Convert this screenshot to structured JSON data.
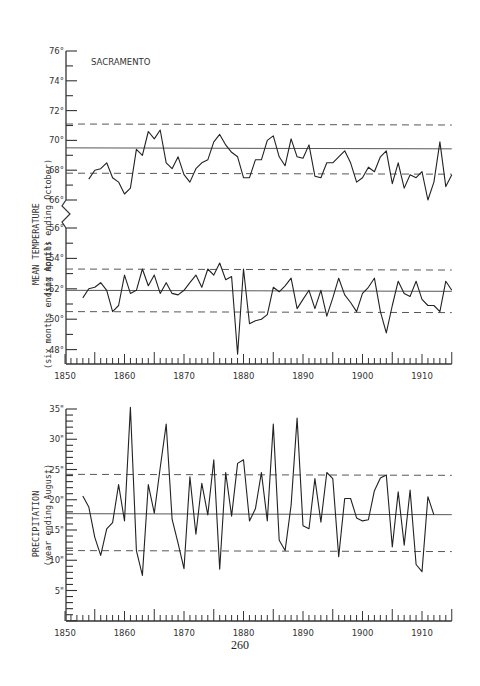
{
  "page": {
    "number": "260"
  },
  "chart_data": [
    {
      "type": "line",
      "title": "SACRAMENTO",
      "panel": "temperature-summer",
      "ylabel": "MEAN TEMPERATURE",
      "ysublabel": "(six months ending October)",
      "ylim": [
        66,
        76
      ],
      "yticks": [
        "66°",
        "68°",
        "70°",
        "72°",
        "74°",
        "76°"
      ],
      "mean": 69.5,
      "upper_dashed": 71.1,
      "lower_dashed": 67.8,
      "x": [
        1854,
        1855,
        1856,
        1857,
        1858,
        1859,
        1860,
        1861,
        1862,
        1863,
        1864,
        1865,
        1866,
        1867,
        1868,
        1869,
        1870,
        1871,
        1872,
        1873,
        1874,
        1875,
        1876,
        1877,
        1878,
        1879,
        1880,
        1881,
        1882,
        1883,
        1884,
        1885,
        1886,
        1887,
        1888,
        1889,
        1890,
        1891,
        1892,
        1893,
        1894,
        1895,
        1896,
        1897,
        1898,
        1899,
        1900,
        1901,
        1902,
        1903,
        1904,
        1905,
        1906,
        1907,
        1908,
        1909,
        1910,
        1911,
        1912,
        1913,
        1914,
        1915
      ],
      "values": [
        67.4,
        68.0,
        68.1,
        68.5,
        67.5,
        67.2,
        66.4,
        66.8,
        69.4,
        69.0,
        70.6,
        70.1,
        70.7,
        68.5,
        68.1,
        68.9,
        67.7,
        67.2,
        68.1,
        68.5,
        68.7,
        69.9,
        70.4,
        69.7,
        69.2,
        68.9,
        67.5,
        67.5,
        68.7,
        68.7,
        70.0,
        70.3,
        68.9,
        68.3,
        70.1,
        68.9,
        68.8,
        69.7,
        67.6,
        67.5,
        68.5,
        68.5,
        68.9,
        69.3,
        68.5,
        67.2,
        67.5,
        68.2,
        67.9,
        68.9,
        69.3,
        67.1,
        68.5,
        66.8,
        67.7,
        67.5,
        67.9,
        66.0,
        67.2,
        69.9,
        66.9,
        67.7
      ]
    },
    {
      "type": "line",
      "panel": "temperature-winter",
      "ylabel": "MEAN TEMPERATURE",
      "ysublabel": "(six months ending April)",
      "ylim": [
        47,
        56
      ],
      "yticks": [
        "48°",
        "50°",
        "52°",
        "54°",
        "56°"
      ],
      "mean": 51.9,
      "upper_dashed": 53.3,
      "lower_dashed": 50.5,
      "x": [
        1853,
        1854,
        1855,
        1856,
        1857,
        1858,
        1859,
        1860,
        1861,
        1862,
        1863,
        1864,
        1865,
        1866,
        1867,
        1868,
        1869,
        1870,
        1871,
        1872,
        1873,
        1874,
        1875,
        1876,
        1877,
        1878,
        1879,
        1880,
        1881,
        1882,
        1883,
        1884,
        1885,
        1886,
        1887,
        1888,
        1889,
        1890,
        1891,
        1892,
        1893,
        1894,
        1895,
        1896,
        1897,
        1898,
        1899,
        1900,
        1901,
        1902,
        1903,
        1904,
        1905,
        1906,
        1907,
        1908,
        1909,
        1910,
        1911,
        1912,
        1913,
        1914,
        1915
      ],
      "values": [
        51.4,
        52.0,
        52.1,
        52.4,
        51.9,
        50.5,
        50.9,
        52.9,
        51.7,
        51.9,
        53.3,
        52.2,
        52.9,
        51.7,
        52.4,
        51.7,
        51.6,
        51.9,
        52.4,
        52.9,
        52.1,
        53.3,
        52.9,
        53.7,
        52.6,
        52.8,
        47.7,
        53.3,
        49.7,
        49.9,
        50.0,
        50.3,
        52.1,
        51.8,
        52.2,
        52.7,
        50.7,
        51.3,
        51.9,
        50.7,
        51.9,
        50.2,
        51.4,
        52.7,
        51.6,
        51.1,
        50.5,
        51.7,
        52.1,
        52.7,
        50.5,
        49.1,
        50.9,
        52.5,
        51.7,
        51.5,
        52.5,
        51.3,
        50.9,
        50.9,
        50.5,
        52.5,
        51.9
      ]
    },
    {
      "type": "line",
      "panel": "precipitation",
      "ylabel": "PRECIPITATION",
      "ysublabel": "(year ending August)",
      "ylim": [
        0,
        35
      ],
      "yticks": [
        "5\"",
        "10\"",
        "15\"",
        "20\"",
        "25\"",
        "30\"",
        "35\""
      ],
      "mean": 17.7,
      "upper_dashed": 24.2,
      "lower_dashed": 11.6,
      "x": [
        1853,
        1854,
        1855,
        1856,
        1857,
        1858,
        1859,
        1860,
        1861,
        1862,
        1863,
        1864,
        1865,
        1866,
        1867,
        1868,
        1869,
        1870,
        1871,
        1872,
        1873,
        1874,
        1875,
        1876,
        1877,
        1878,
        1879,
        1880,
        1881,
        1882,
        1883,
        1884,
        1885,
        1886,
        1887,
        1888,
        1889,
        1890,
        1891,
        1892,
        1893,
        1894,
        1895,
        1896,
        1897,
        1898,
        1899,
        1900,
        1901,
        1902,
        1903,
        1904,
        1905,
        1906,
        1907,
        1908,
        1909,
        1910,
        1911,
        1912,
        1913,
        1914
      ],
      "values": [
        20.6,
        18.8,
        13.8,
        10.8,
        15.2,
        16.2,
        22.5,
        16.5,
        35.3,
        11.6,
        7.5,
        22.5,
        17.8,
        25.3,
        32.5,
        16.8,
        12.8,
        8.6,
        23.8,
        14.3,
        22.7,
        17.5,
        26.6,
        8.5,
        24.5,
        17.3,
        26.0,
        26.6,
        16.5,
        18.5,
        24.5,
        16.5,
        32.5,
        13.3,
        11.6,
        19.1,
        33.5,
        15.7,
        15.2,
        23.5,
        16.3,
        24.5,
        23.5,
        10.6,
        20.2,
        20.2,
        17.0,
        16.5,
        16.7,
        21.5,
        23.6,
        24.1,
        12.2,
        21.3,
        12.5,
        21.6,
        9.3,
        8.1,
        20.5,
        17.5
      ]
    }
  ],
  "x_axis": {
    "xlim": [
      1850,
      1915
    ],
    "tick_labels": [
      "1850",
      "1860",
      "1870",
      "1880",
      "1890",
      "1900",
      "1910"
    ]
  }
}
